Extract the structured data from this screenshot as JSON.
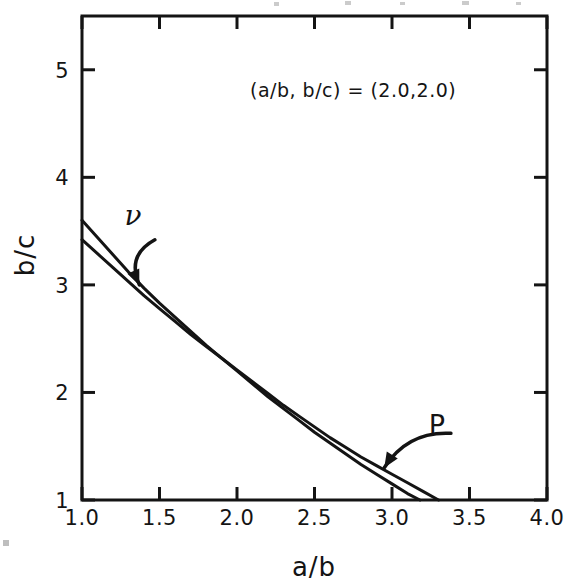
{
  "figure": {
    "background": "#ffffff",
    "ink_color": "#141414"
  },
  "chart_data": {
    "type": "line",
    "title": "",
    "subtitle": "",
    "annotation": "(a/b, b/c) = (2.0,2.0)",
    "xlabel": "a/b",
    "ylabel": "b/c",
    "xlim": [
      1.0,
      4.0
    ],
    "ylim": [
      1.0,
      5.5
    ],
    "xticks": [
      1.0,
      1.5,
      2.0,
      2.5,
      3.0,
      3.5,
      4.0
    ],
    "xtick_labels": [
      "1.0",
      "1.5",
      "2.0",
      "2.5",
      "3.0",
      "3.5",
      "4.0"
    ],
    "yticks": [
      1,
      2,
      3,
      4,
      5
    ],
    "ytick_labels": [
      "1",
      "2",
      "3",
      "4",
      "5"
    ],
    "grid": false,
    "legend_position": "inline-annotated-arrows",
    "series": [
      {
        "name": "nu",
        "label": "ν",
        "color": "#141414",
        "points": [
          [
            1.0,
            3.6
          ],
          [
            1.1,
            3.44
          ],
          [
            1.2,
            3.28
          ],
          [
            1.3,
            3.12
          ],
          [
            1.4,
            2.97
          ],
          [
            1.5,
            2.83
          ],
          [
            1.6,
            2.7
          ],
          [
            1.7,
            2.57
          ],
          [
            1.8,
            2.44
          ],
          [
            1.9,
            2.32
          ],
          [
            2.0,
            2.2
          ],
          [
            2.1,
            2.08
          ],
          [
            2.2,
            1.96
          ],
          [
            2.3,
            1.85
          ],
          [
            2.4,
            1.74
          ],
          [
            2.5,
            1.63
          ],
          [
            2.6,
            1.53
          ],
          [
            2.7,
            1.43
          ],
          [
            2.8,
            1.33
          ],
          [
            2.9,
            1.24
          ],
          [
            3.0,
            1.15
          ],
          [
            3.1,
            1.06
          ],
          [
            3.18,
            1.0
          ]
        ]
      },
      {
        "name": "P",
        "label": "P",
        "color": "#141414",
        "points": [
          [
            1.0,
            3.42
          ],
          [
            1.1,
            3.29
          ],
          [
            1.2,
            3.16
          ],
          [
            1.3,
            3.03
          ],
          [
            1.4,
            2.9
          ],
          [
            1.5,
            2.78
          ],
          [
            1.6,
            2.66
          ],
          [
            1.7,
            2.54
          ],
          [
            1.8,
            2.43
          ],
          [
            1.9,
            2.32
          ],
          [
            2.0,
            2.21
          ],
          [
            2.1,
            2.1
          ],
          [
            2.2,
            1.99
          ],
          [
            2.3,
            1.88
          ],
          [
            2.4,
            1.78
          ],
          [
            2.5,
            1.68
          ],
          [
            2.6,
            1.58
          ],
          [
            2.7,
            1.49
          ],
          [
            2.8,
            1.4
          ],
          [
            2.9,
            1.32
          ],
          [
            3.0,
            1.24
          ],
          [
            3.1,
            1.16
          ],
          [
            3.2,
            1.08
          ],
          [
            3.3,
            1.0
          ]
        ]
      }
    ],
    "annotations": [
      {
        "name": "nu-callout",
        "text": "ν",
        "label_x": 1.47,
        "label_y": 3.42,
        "arrow_tip_x": 1.37,
        "arrow_tip_y": 3.0
      },
      {
        "name": "P-callout",
        "text": "P",
        "label_x": 3.38,
        "label_y": 1.62,
        "arrow_tip_x": 2.95,
        "arrow_tip_y": 1.3
      }
    ]
  }
}
